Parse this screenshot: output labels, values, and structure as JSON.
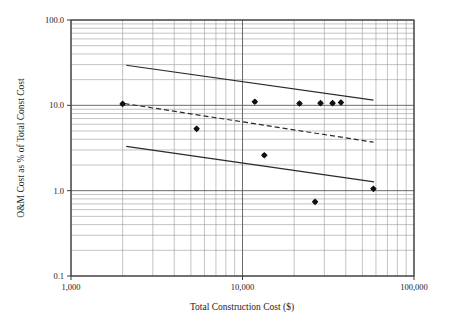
{
  "chart_data": {
    "type": "scatter",
    "title": "",
    "xlabel": "Total Construction Cost ($)",
    "ylabel": "O&M Cost as % of Total Const Cost",
    "xscale": "log",
    "yscale": "log",
    "xlim": [
      1000,
      100000
    ],
    "ylim": [
      0.1,
      100.0
    ],
    "grid": "both-minor-and-major",
    "legend": "none",
    "x_tick_labels": [
      "1,000",
      "10,000",
      "100,000"
    ],
    "x_tick_values": [
      1000,
      10000,
      100000
    ],
    "y_tick_labels": [
      "100.0",
      "10.0",
      "1.0",
      "0.1"
    ],
    "y_tick_values": [
      100.0,
      10.0,
      1.0,
      0.1
    ],
    "points": [
      {
        "x": 2000,
        "y": 10.4
      },
      {
        "x": 5400,
        "y": 5.3
      },
      {
        "x": 11800,
        "y": 11.0
      },
      {
        "x": 13400,
        "y": 2.6
      },
      {
        "x": 21500,
        "y": 10.5
      },
      {
        "x": 26500,
        "y": 0.74
      },
      {
        "x": 28500,
        "y": 10.6
      },
      {
        "x": 33500,
        "y": 10.6
      },
      {
        "x": 37500,
        "y": 10.8
      },
      {
        "x": 58000,
        "y": 1.05
      }
    ],
    "series": [
      {
        "name": "upper-bound-line",
        "style": "solid",
        "points": [
          {
            "x": 2100,
            "y": 29.5
          },
          {
            "x": 58000,
            "y": 11.5
          }
        ]
      },
      {
        "name": "mean-trend-line",
        "style": "dashed",
        "points": [
          {
            "x": 2050,
            "y": 10.5
          },
          {
            "x": 58000,
            "y": 3.7
          }
        ]
      },
      {
        "name": "lower-bound-line",
        "style": "solid",
        "points": [
          {
            "x": 2100,
            "y": 3.3
          },
          {
            "x": 58500,
            "y": 1.27
          }
        ]
      }
    ],
    "colors": {
      "axis": "#3a3a3a",
      "grid_major": "#5a5a5a",
      "grid_minor": "#9a9a9a",
      "line": "#2a2a2a",
      "marker": "#111111",
      "background": "#ffffff"
    }
  }
}
